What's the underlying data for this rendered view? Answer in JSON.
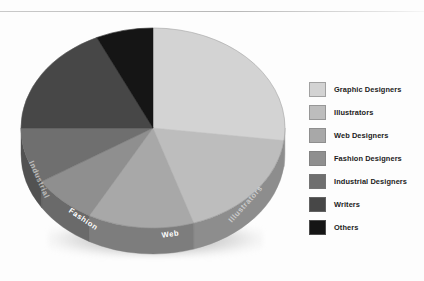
{
  "chart_data": {
    "type": "pie",
    "title": "",
    "subtitle": "",
    "xlabel": "",
    "ylabel": "",
    "legend_position": "right",
    "grid": false,
    "style": "3d-pie",
    "categories": [
      "Graphic Designers",
      "Illustrators",
      "Web Designers",
      "Fashion Designers",
      "Industrial Designers",
      "Writers",
      "Others"
    ],
    "values": [
      27,
      18,
      13,
      8,
      9,
      18,
      7
    ],
    "unit": "%",
    "colors": [
      "#d3d3d3",
      "#bdbdbd",
      "#a8a8a8",
      "#8f8f8f",
      "#6f6f6f",
      "#474747",
      "#151515"
    ],
    "rim_colors": [
      "#9f9f9f",
      "#8d8d8d",
      "#7d7d7d",
      "#6a6a6a",
      "#525252",
      "#343434",
      "#0f0f0f"
    ],
    "slice_labels": [
      {
        "text": "Illustrators",
        "placement": "rim",
        "faint": true
      },
      {
        "text": "Web",
        "placement": "rim",
        "faint": false
      },
      {
        "text": "Fashion",
        "placement": "rim",
        "faint": false
      },
      {
        "text": "Industrial",
        "placement": "rim",
        "faint": true
      }
    ]
  },
  "legend": {
    "items": [
      {
        "label": "Graphic Designers",
        "color": "#d3d3d3"
      },
      {
        "label": "Illustrators",
        "color": "#bdbdbd"
      },
      {
        "label": "Web Designers",
        "color": "#a8a8a8"
      },
      {
        "label": "Fashion Designers",
        "color": "#8f8f8f"
      },
      {
        "label": "Industrial Designers",
        "color": "#6f6f6f"
      },
      {
        "label": "Writers",
        "color": "#474747"
      },
      {
        "label": "Others",
        "color": "#151515"
      }
    ]
  },
  "rim_labels": {
    "illustrators": "Illustrators",
    "web": "Web",
    "fashion": "Fashion",
    "industrial": "Industrial"
  }
}
